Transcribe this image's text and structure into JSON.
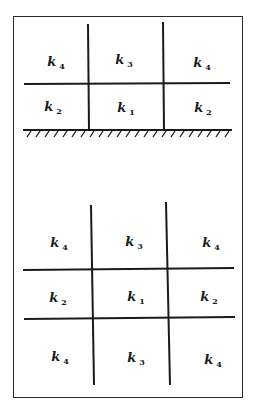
{
  "diagram": {
    "top_grid": {
      "description": "2x3 grid resting on a hatched ground boundary",
      "rows": [
        [
          {
            "base": "k",
            "sub": "4"
          },
          {
            "base": "k",
            "sub": "3"
          },
          {
            "base": "k",
            "sub": "4"
          }
        ],
        [
          {
            "base": "k",
            "sub": "2"
          },
          {
            "base": "k",
            "sub": "1"
          },
          {
            "base": "k",
            "sub": "2"
          }
        ]
      ],
      "boundary": "hatched-ground"
    },
    "bottom_grid": {
      "description": "3x3 grid, unbounded",
      "rows": [
        [
          {
            "base": "k",
            "sub": "4"
          },
          {
            "base": "k",
            "sub": "3"
          },
          {
            "base": "k",
            "sub": "4"
          }
        ],
        [
          {
            "base": "k",
            "sub": "2"
          },
          {
            "base": "k",
            "sub": "1"
          },
          {
            "base": "k",
            "sub": "2"
          }
        ],
        [
          {
            "base": "k",
            "sub": "4"
          },
          {
            "base": "k",
            "sub": "3"
          },
          {
            "base": "k",
            "sub": "4"
          }
        ]
      ]
    },
    "line_color": "#1a1a1a"
  }
}
